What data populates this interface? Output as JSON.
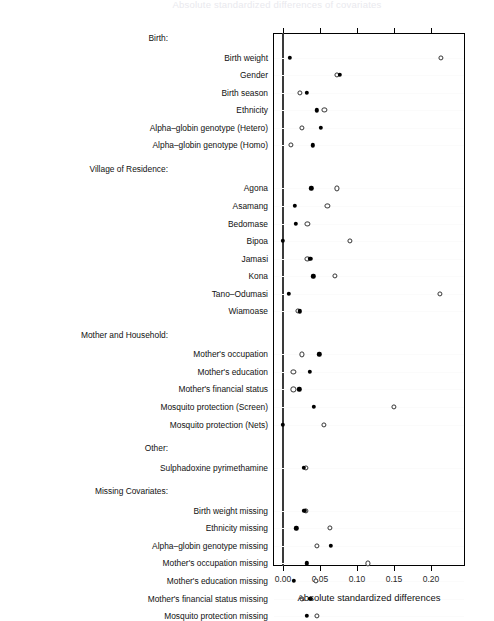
{
  "title": "Absolute standardized differences of covariates",
  "axis": {
    "xlabel": "Absolute standardized differences",
    "ticks": [
      "0.00",
      "0.05",
      "0.10",
      "0.15",
      "0.20"
    ],
    "tickvalues": [
      0.0,
      0.05,
      0.1,
      0.15,
      0.2
    ],
    "xlim": [
      -0.013,
      0.246
    ]
  },
  "legend": {
    "filled_name": "Adjusted",
    "open_name": "Unadjusted"
  },
  "chart_data": {
    "type": "scatter",
    "title": "Absolute standardized differences of covariates",
    "xlabel": "Absolute standardized differences",
    "ylabel": "",
    "xlim": [
      -0.013,
      0.246
    ],
    "grid": false,
    "legend_position": "none",
    "series": [
      {
        "name": "Adjusted",
        "marker": "filled-circle"
      },
      {
        "name": "Unadjusted",
        "marker": "open-circle"
      }
    ],
    "groups": [
      {
        "group": "Birth:",
        "rows": [
          {
            "label": "Birth weight",
            "filled": 0.009,
            "open": 0.213
          },
          {
            "label": "Gender",
            "filled": 0.077,
            "open": 0.073
          },
          {
            "label": "Birth season",
            "filled": 0.032,
            "open": 0.023
          },
          {
            "label": "Ethnicity",
            "filled": 0.046,
            "open": 0.056
          },
          {
            "label": "Alpha–globin genotype (Hetero)",
            "filled": 0.051,
            "open": 0.026
          },
          {
            "label": "Alpha–globin genotype (Homo)",
            "filled": 0.04,
            "open": 0.011
          }
        ]
      },
      {
        "group": "Village of Residence:",
        "rows": [
          {
            "label": "Agona",
            "filled": 0.038,
            "open": 0.073
          },
          {
            "label": "Asamang",
            "filled": 0.016,
            "open": 0.06
          },
          {
            "label": "Bedomase",
            "filled": 0.017,
            "open": 0.033
          },
          {
            "label": "Bipoa",
            "filled": 0.0,
            "open": 0.09
          },
          {
            "label": "Jamasi",
            "filled": 0.037,
            "open": 0.033
          },
          {
            "label": "Kona",
            "filled": 0.041,
            "open": 0.07
          },
          {
            "label": "Tano–Odumasi",
            "filled": 0.008,
            "open": 0.212
          },
          {
            "label": "Wiamoase",
            "filled": 0.023,
            "open": 0.02
          }
        ]
      },
      {
        "group": "Mother and Household:",
        "rows": [
          {
            "label": "Mother's occupation",
            "filled": 0.049,
            "open": 0.026
          },
          {
            "label": "Mother's education",
            "filled": 0.036,
            "open": 0.014
          },
          {
            "label": "Mother's financial status",
            "filled": 0.022,
            "open": 0.014
          },
          {
            "label": "Mosquito protection (Screen)",
            "filled": 0.042,
            "open": 0.15
          },
          {
            "label": "Mosquito protection (Nets)",
            "filled": 0.0,
            "open": 0.055
          }
        ]
      },
      {
        "group": "Other:",
        "rows": [
          {
            "label": "Sulphadoxine pyrimethamine",
            "filled": 0.028,
            "open": 0.031
          }
        ]
      },
      {
        "group": "Missing Covariates:",
        "rows": [
          {
            "label": "Birth weight missing",
            "filled": 0.029,
            "open": 0.031
          },
          {
            "label": "Ethnicity missing",
            "filled": 0.018,
            "open": 0.063
          },
          {
            "label": "Alpha–globin genotype missing",
            "filled": 0.065,
            "open": 0.046
          },
          {
            "label": "Mother's occupation missing",
            "filled": 0.032,
            "open": 0.115
          },
          {
            "label": "Mother's education missing",
            "filled": 0.015,
            "open": 0.045
          },
          {
            "label": "Mother's financial status missing",
            "filled": 0.037,
            "open": 0.026
          },
          {
            "label": "Mosquito protection missing",
            "filled": 0.032,
            "open": 0.046
          }
        ]
      }
    ]
  }
}
